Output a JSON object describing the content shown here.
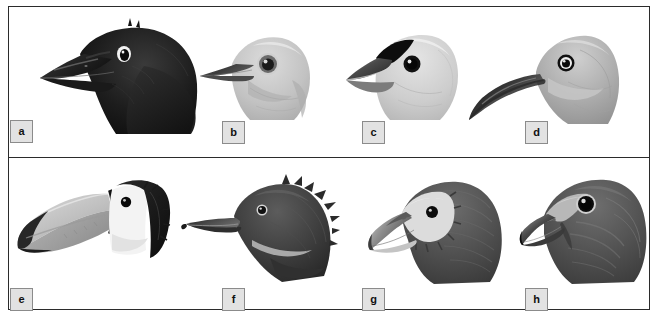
{
  "figure": {
    "id": "bird-head-plate",
    "border_color": "#2b2b2b",
    "background": "#ffffff",
    "label_bg": "#e2e2e2",
    "label_border": "#8b8b8b",
    "label_text_color": "#111111",
    "rows": 2,
    "columns": 4,
    "total_panels": 8
  },
  "panels": [
    {
      "label": "a",
      "name": "crow-head",
      "description": "Black corvid head in left profile with heavy straight conical bill, nasal bristles over the nostrils and a pale ringed eye",
      "bill_shape": "stout straight conical",
      "plumage_tone": "black",
      "eye": "white-ringed dark eye",
      "row": 1,
      "column": 1
    },
    {
      "label": "b",
      "name": "pale-songbird-head",
      "description": "Plain pale grey rounded songbird head with a slender sharply pointed dark bill and a large dark eye",
      "bill_shape": "slender pointed",
      "plumage_tone": "pale grey",
      "eye": "large dark eye with pale ring",
      "row": 1,
      "column": 2
    },
    {
      "label": "c",
      "name": "finch-head",
      "description": "Pale grey finch head with a very deep triangular conical seed-cracking bill and a black forehead and lores patch",
      "bill_shape": "deep triangular conical",
      "plumage_tone": "pale grey with black face mask",
      "eye": "small dark eye",
      "row": 1,
      "column": 3
    },
    {
      "label": "d",
      "name": "curlew-head",
      "description": "Grey wader head with an extremely long smoothly decurved probing bill and a pale ringed eye",
      "bill_shape": "very long decurved",
      "plumage_tone": "medium grey, paler throat",
      "eye": "dark eye with white ring",
      "row": 1,
      "column": 4
    },
    {
      "label": "e",
      "name": "toucan-head",
      "description": "Toucan head with an enormous pale keel-shaped bill tipped black, white face and throat, and black crown and nape",
      "bill_shape": "enormous deep keel-shaped",
      "plumage_tone": "black crown and nape, white face",
      "eye": "small black eye",
      "row": 2,
      "column": 1
    },
    {
      "label": "f",
      "name": "merganser-head",
      "description": "Dark duck head with a shaggy ragged crest and a long narrow serrated hooked fish-catching bill",
      "bill_shape": "long narrow serrated hooked",
      "plumage_tone": "dark slate grey with pale throat wedge",
      "eye": "small pale-ringed eye",
      "row": 2,
      "column": 2
    },
    {
      "label": "g",
      "name": "vulture-head",
      "description": "Vulture head with a bare whitish face, dark bristly crown and nape and a pale hooked tearing bill",
      "bill_shape": "hooked with pale tip and cere",
      "plumage_tone": "dark brown-grey with whitish bare face",
      "eye": "small dark eye on pale face",
      "row": 2,
      "column": 3
    },
    {
      "label": "h",
      "name": "hawk-head",
      "description": "Accipiter or buteo head with a short deeply hooked dark bill, pale cere and a large dark eye set in a pale supercilium",
      "bill_shape": "short strongly hooked",
      "plumage_tone": "streaked grey-brown",
      "eye": "large dark eye with pale ring",
      "row": 2,
      "column": 4
    }
  ]
}
